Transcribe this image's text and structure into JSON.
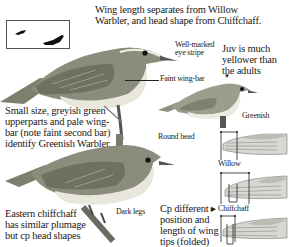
{
  "silhouettes": {
    "icons": [
      "small-bird-silhouette-icon",
      "large-bird-silhouette-icon"
    ]
  },
  "header": {
    "line1": "Wing length separates from Willow",
    "line2": "Warbler, and head shape from Chiffchaff."
  },
  "annotations": {
    "eye_stripe": [
      "Well-marked",
      "eye stripe"
    ],
    "faint_wing_bar": "Faint wing-bar",
    "juv": [
      "Juv is much",
      "yellower than",
      "the adults"
    ],
    "greenish": "Greenish",
    "round_head": "Round head",
    "dark_legs": "Dark legs",
    "willow": "Willow",
    "chiffchaff": "Chiffchaff"
  },
  "left_caption": {
    "lines": [
      "Small size, greyish green",
      "upperparts and pale wing-",
      "bar (note faint second bar)",
      "identify Greenish Warbler."
    ]
  },
  "bottom_caption": {
    "lines": [
      "Eastern chiffchaff",
      "has similar plumage",
      "but cp head shapes"
    ]
  },
  "wing_caption": {
    "lines": [
      "Cp different ▸",
      "position and",
      "length of wing",
      "tips (folded)"
    ]
  },
  "colors": {
    "bird_upper": "#8a8d7c",
    "bird_under": "#e9e7dc",
    "wing_dark": "#6e715f",
    "ink": "#1a1a1a"
  }
}
